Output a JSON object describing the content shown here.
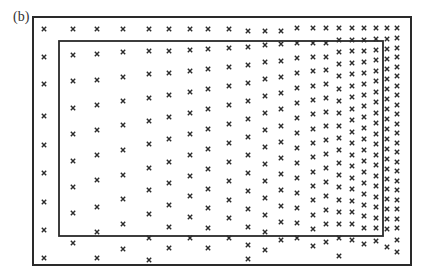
{
  "figure": {
    "panel_label": "(b)",
    "colors": {
      "ink": "#2a2a2a",
      "background": "#ffffff"
    },
    "outer_frame": {
      "x1": 33,
      "y1": 17,
      "x2": 411,
      "y2": 265
    },
    "inner_frame": {
      "x1": 59,
      "y1": 41,
      "x2": 383,
      "y2": 236
    },
    "marker": "cross",
    "columns": [
      {
        "x": 44,
        "ys": [
          29,
          57,
          84,
          116,
          145,
          173,
          202,
          230,
          258
        ]
      },
      {
        "x": 73,
        "ys": [
          29,
          55,
          81,
          108,
          134,
          161,
          187,
          213,
          243
        ]
      },
      {
        "x": 97,
        "ys": [
          29,
          54,
          80,
          105,
          130,
          155,
          180,
          207,
          232,
          258
        ]
      },
      {
        "x": 123,
        "ys": [
          29,
          52,
          77,
          101,
          125,
          150,
          175,
          199,
          224,
          249
        ]
      },
      {
        "x": 149,
        "ys": [
          29,
          51,
          74,
          98,
          121,
          144,
          168,
          190,
          214,
          238,
          260
        ]
      },
      {
        "x": 169,
        "ys": [
          29,
          51,
          73,
          95,
          117,
          139,
          162,
          183,
          205,
          227,
          248
        ]
      },
      {
        "x": 190,
        "ys": [
          29,
          50,
          71,
          92,
          113,
          134,
          155,
          176,
          196,
          217,
          238
        ]
      },
      {
        "x": 208,
        "ys": [
          29,
          49,
          69,
          89,
          109,
          129,
          149,
          169,
          189,
          208,
          228,
          248
        ]
      },
      {
        "x": 229,
        "ys": [
          29,
          48,
          67,
          86,
          105,
          124,
          143,
          162,
          181,
          200,
          218,
          238
        ]
      },
      {
        "x": 248,
        "ys": [
          31,
          47,
          65,
          83,
          101,
          119,
          137,
          155,
          173,
          191,
          209,
          227,
          245,
          259
        ]
      },
      {
        "x": 265,
        "ys": [
          31,
          45,
          62,
          79,
          96,
          113,
          130,
          147,
          164,
          181,
          198,
          215,
          232,
          250
        ]
      },
      {
        "x": 281,
        "ys": [
          31,
          44,
          61,
          77,
          93,
          109,
          126,
          142,
          158,
          174,
          190,
          206,
          222,
          240
        ]
      },
      {
        "x": 297,
        "ys": [
          28,
          43,
          58,
          73,
          88,
          103,
          118,
          133,
          148,
          163,
          178,
          193,
          208,
          223,
          238
        ]
      },
      {
        "x": 313,
        "ys": [
          28,
          43,
          57,
          71,
          86,
          100,
          114,
          129,
          143,
          157,
          172,
          186,
          200,
          215,
          229,
          246
        ]
      },
      {
        "x": 326,
        "ys": [
          28,
          43,
          57,
          70,
          84,
          98,
          112,
          126,
          140,
          154,
          168,
          182,
          196,
          210,
          224,
          242
        ]
      },
      {
        "x": 339,
        "ys": [
          28,
          40,
          52,
          64,
          76,
          89,
          101,
          113,
          126,
          138,
          150,
          163,
          175,
          187,
          200,
          212,
          224,
          238,
          256
        ]
      },
      {
        "x": 352,
        "ys": [
          28,
          40,
          51,
          63,
          74,
          86,
          97,
          109,
          120,
          132,
          143,
          155,
          166,
          178,
          189,
          201,
          212,
          224,
          240
        ]
      },
      {
        "x": 364,
        "ys": [
          28,
          40,
          51,
          62,
          73,
          84,
          95,
          106,
          117,
          128,
          139,
          150,
          161,
          172,
          183,
          194,
          205,
          216,
          228,
          244
        ]
      },
      {
        "x": 376,
        "ys": [
          28,
          39,
          50,
          60,
          71,
          81,
          92,
          102,
          113,
          123,
          134,
          144,
          155,
          165,
          176,
          186,
          197,
          207,
          218,
          228,
          241
        ]
      },
      {
        "x": 387,
        "ys": [
          28,
          39,
          49,
          59,
          69,
          79,
          89,
          99,
          109,
          119,
          129,
          139,
          149,
          159,
          169,
          179,
          189,
          199,
          209,
          219,
          229,
          247
        ]
      },
      {
        "x": 397,
        "ys": [
          28,
          38,
          48,
          57,
          67,
          76,
          86,
          95,
          105,
          114,
          124,
          133,
          143,
          152,
          162,
          171,
          181,
          190,
          200,
          209,
          219,
          228,
          240,
          252
        ]
      }
    ]
  }
}
